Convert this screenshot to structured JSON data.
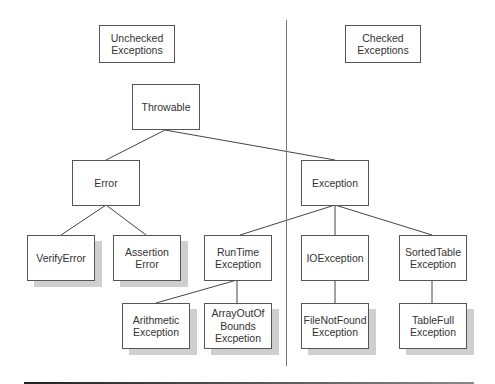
{
  "legend": {
    "unchecked": "Unchecked\nExceptions",
    "checked": "Checked\nExceptions"
  },
  "nodes": {
    "throwable": "Throwable",
    "error": "Error",
    "exception": "Exception",
    "verify_error": "VerifyError",
    "assertion_error": "Assertion\nError",
    "runtime_exception": "RunTime\nException",
    "io_exception": "IOException",
    "sorted_table_exception": "SortedTable\nException",
    "arithmetic_exception": "Arithmetic\nException",
    "array_out_of_bounds": "ArrayOutOf\nBounds\nExcpetion",
    "file_not_found_exception": "FileNotFound\nException",
    "table_full_exception": "TableFull\nException"
  },
  "edges": [
    [
      "Throwable",
      "Error"
    ],
    [
      "Throwable",
      "Exception"
    ],
    [
      "Error",
      "VerifyError"
    ],
    [
      "Error",
      "Assertion Error"
    ],
    [
      "Exception",
      "RunTime Exception"
    ],
    [
      "Exception",
      "IOException"
    ],
    [
      "Exception",
      "SortedTable Exception"
    ],
    [
      "RunTime Exception",
      "Arithmetic Exception"
    ],
    [
      "RunTime Exception",
      "ArrayOutOf Bounds Excpetion"
    ],
    [
      "IOException",
      "FileNotFound Exception"
    ],
    [
      "SortedTable Exception",
      "TableFull Exception"
    ]
  ],
  "colors": {
    "border": "#555555",
    "shadow": "#cfcfcf",
    "line": "#444444"
  }
}
